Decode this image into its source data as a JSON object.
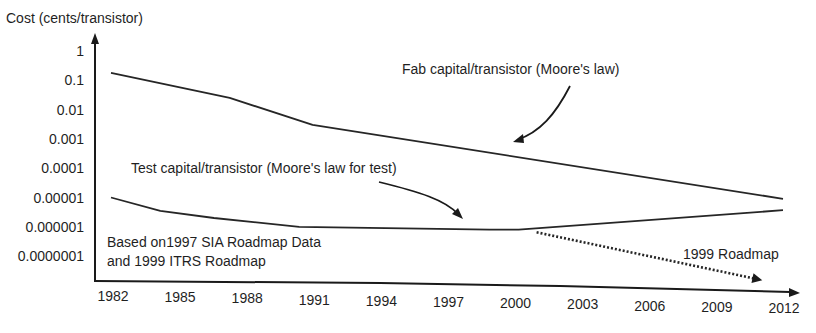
{
  "chart_data": {
    "type": "line",
    "title": "",
    "ylabel": "Cost (cents/transistor)",
    "xlabel": "",
    "yscale": "log",
    "ylim": [
      1e-07,
      1
    ],
    "xlim": [
      1982,
      2012
    ],
    "x_ticks": [
      "1982",
      "1985",
      "1988",
      "1991",
      "1994",
      "1997",
      "2000",
      "2003",
      "2006",
      "2009",
      "2012"
    ],
    "y_ticks": [
      "1",
      "0.1",
      "0.01",
      "0.001",
      "0.0001",
      "0.00001",
      "0.000001",
      "0.0000001"
    ],
    "grid": false,
    "series": [
      {
        "name": "Fab capital/transistor (Moore's law)",
        "style": "solid",
        "x": [
          1982.0,
          1987.3,
          1991.0,
          2012.0
        ],
        "values": [
          0.18,
          0.025,
          0.003,
          9e-06
        ]
      },
      {
        "name": "Test capital/transistor (Moore's law for test)",
        "style": "solid",
        "x": [
          1982.0,
          1984.2,
          1986.6,
          1990.4,
          1998.9,
          2000.2,
          2012.0
        ],
        "values": [
          1e-05,
          3.5e-06,
          2e-06,
          1e-06,
          8e-07,
          8e-07,
          3.7e-06
        ]
      },
      {
        "name": "1999 Roadmap",
        "style": "dotted",
        "x": [
          2001.0,
          2010.9
        ],
        "values": [
          6.5e-07,
          1.6e-08
        ]
      }
    ],
    "annotations": [
      {
        "id": "fab",
        "text": "Fab capital/transistor (Moore's law)"
      },
      {
        "id": "test",
        "text": "Test capital/transistor (Moore's law for test)"
      },
      {
        "id": "note1",
        "text": "Based on1997 SIA Roadmap Data"
      },
      {
        "id": "note2",
        "text": "and 1999 ITRS Roadmap"
      },
      {
        "id": "roadmap",
        "text": "1999 Roadmap"
      }
    ]
  }
}
